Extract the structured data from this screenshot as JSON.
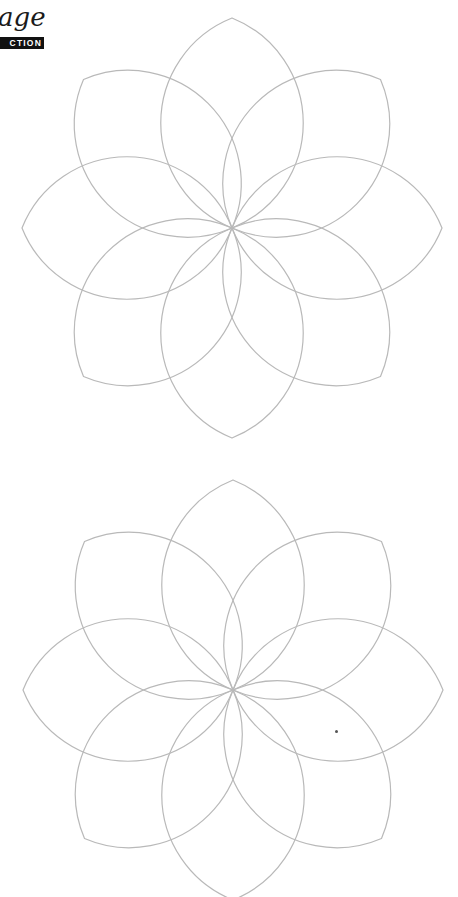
{
  "header": {
    "title_fragment": "age",
    "badge_fragment": "CTION",
    "badge_bg": "#111111",
    "badge_fg": "#ffffff"
  },
  "style": {
    "line_color": "#b9b9b9",
    "line_width": 1.2,
    "background": "#ffffff"
  },
  "flowers": [
    {
      "name": "flower-top",
      "cx": 232,
      "cy": 228,
      "tip_radius": 210,
      "petals": 8,
      "arc_radius": 113,
      "rotation_deg": 0
    },
    {
      "name": "flower-bottom",
      "cx": 233,
      "cy": 690,
      "tip_radius": 210,
      "petals": 8,
      "arc_radius": 113,
      "rotation_deg": 0
    }
  ],
  "marks": [
    {
      "name": "speck",
      "x": 335,
      "y": 730
    }
  ]
}
